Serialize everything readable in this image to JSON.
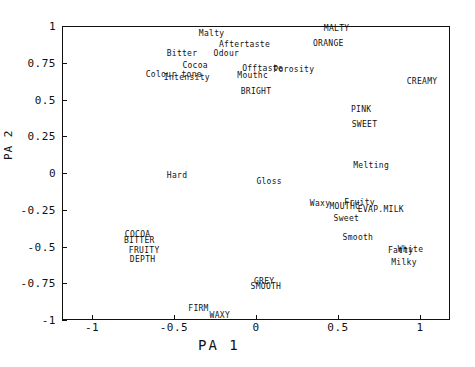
{
  "chart_data": {
    "type": "scatter",
    "title": "",
    "xlabel": "PA 1",
    "ylabel": "PA 2",
    "xlim": [
      -1.18,
      1.18
    ],
    "ylim": [
      -1,
      1
    ],
    "grid": false,
    "legend": "none",
    "xticks": [
      "-1",
      "-0.5",
      "0",
      "0.5",
      "1"
    ],
    "xtickvalues": [
      -1,
      -0.5,
      0,
      0.5,
      1
    ],
    "yticks": [
      "1",
      "0.75",
      "0.5",
      "0.25",
      "0",
      "-0.25",
      "-0.5",
      "-0.75",
      "-1"
    ],
    "ytickvalues": [
      1,
      0.75,
      0.5,
      0.25,
      0,
      -0.25,
      -0.5,
      -0.75,
      -1
    ],
    "marker": "text-label-only",
    "points": [
      {
        "label": "Malty",
        "x": -0.27,
        "y": 0.955
      },
      {
        "label": "MALTY",
        "x": 0.49,
        "y": 0.985
      },
      {
        "label": "Aftertaste",
        "x": -0.07,
        "y": 0.875
      },
      {
        "label": "ORANGE",
        "x": 0.44,
        "y": 0.885
      },
      {
        "label": "Bitter",
        "x": -0.45,
        "y": 0.815
      },
      {
        "label": "Odour",
        "x": -0.18,
        "y": 0.815
      },
      {
        "label": "Cocoa",
        "x": -0.37,
        "y": 0.735
      },
      {
        "label": "Offtaste",
        "x": 0.04,
        "y": 0.715
      },
      {
        "label": "Porosity",
        "x": 0.23,
        "y": 0.705
      },
      {
        "label": "Colour tone",
        "x": -0.5,
        "y": 0.675
      },
      {
        "label": "Intensity",
        "x": -0.42,
        "y": 0.655
      },
      {
        "label": "Mouthc",
        "x": -0.02,
        "y": 0.665
      },
      {
        "label": "CREAMY",
        "x": 1.01,
        "y": 0.625
      },
      {
        "label": "BRIGHT",
        "x": 0.0,
        "y": 0.555
      },
      {
        "label": "PINK",
        "x": 0.64,
        "y": 0.435
      },
      {
        "label": "SWEET",
        "x": 0.66,
        "y": 0.335
      },
      {
        "label": "Melting",
        "x": 0.7,
        "y": 0.055
      },
      {
        "label": "Hard",
        "x": -0.48,
        "y": -0.015
      },
      {
        "label": "Gloss",
        "x": 0.08,
        "y": -0.055
      },
      {
        "label": "Waxy",
        "x": 0.39,
        "y": -0.205
      },
      {
        "label": "Fruity",
        "x": 0.63,
        "y": -0.195
      },
      {
        "label": "MOUTHC",
        "x": 0.54,
        "y": -0.225
      },
      {
        "label": "EVAP.MILK",
        "x": 0.76,
        "y": -0.245
      },
      {
        "label": "Sweet",
        "x": 0.55,
        "y": -0.305
      },
      {
        "label": "COCOA",
        "x": -0.72,
        "y": -0.415
      },
      {
        "label": "BITTER",
        "x": -0.71,
        "y": -0.455
      },
      {
        "label": "Smooth",
        "x": 0.62,
        "y": -0.435
      },
      {
        "label": "FRUITY",
        "x": -0.68,
        "y": -0.525
      },
      {
        "label": "Fatty",
        "x": 0.88,
        "y": -0.525
      },
      {
        "label": "White",
        "x": 0.94,
        "y": -0.515
      },
      {
        "label": "DEPTH",
        "x": -0.69,
        "y": -0.585
      },
      {
        "label": "Milky",
        "x": 0.9,
        "y": -0.605
      },
      {
        "label": "GREY",
        "x": 0.05,
        "y": -0.735
      },
      {
        "label": "SMOOTH",
        "x": 0.06,
        "y": -0.765
      },
      {
        "label": "FIRM",
        "x": -0.35,
        "y": -0.915
      },
      {
        "label": "WAXY",
        "x": -0.22,
        "y": -0.965
      }
    ]
  }
}
